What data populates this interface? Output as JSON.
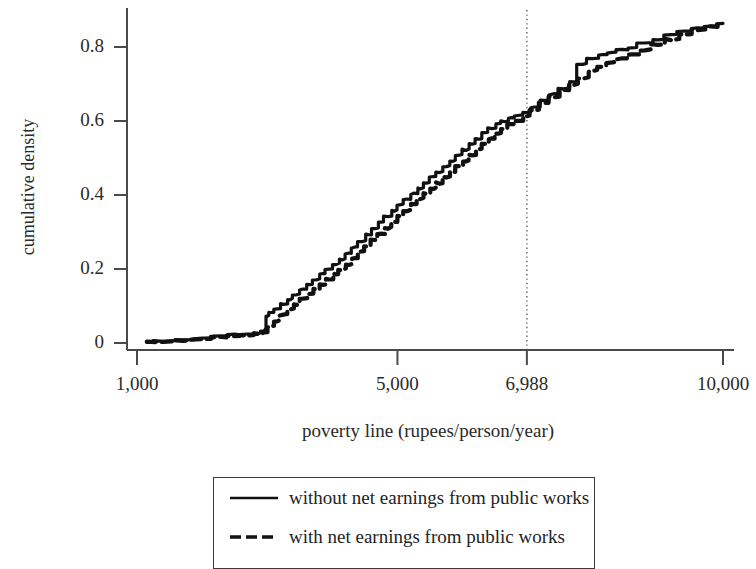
{
  "chart_data": {
    "type": "line",
    "title": "",
    "xlabel": "poverty line (rupees/person/year)",
    "ylabel": "cumulative density",
    "xlim": [
      1000,
      10000
    ],
    "ylim": [
      0,
      0.9
    ],
    "grid": false,
    "legend_position": "bottom",
    "xticks": [
      1000,
      5000,
      6988,
      10000
    ],
    "xtick_labels": [
      "1,000",
      "5,000",
      "6,988",
      "10,000"
    ],
    "yticks": [
      0,
      0.2,
      0.4,
      0.6,
      0.8
    ],
    "ytick_labels": [
      "0",
      "0.2",
      "0.4",
      "0.6",
      "0.8"
    ],
    "annotations": [
      {
        "name": "official-poverty-line-marker",
        "type": "vertical-dotted-line",
        "x": 6988,
        "label": "6,988"
      }
    ],
    "series": [
      {
        "name": "without net earnings from public works",
        "style": "solid",
        "color": "#111111",
        "x": [
          1150,
          1400,
          1700,
          2000,
          2300,
          2500,
          2700,
          2850,
          2950,
          3000,
          3050,
          3150,
          3250,
          3350,
          3450,
          3550,
          3650,
          3750,
          3850,
          3950,
          4050,
          4150,
          4250,
          4350,
          4450,
          4550,
          4650,
          4750,
          4850,
          4950,
          5050,
          5150,
          5250,
          5350,
          5450,
          5550,
          5650,
          5750,
          5850,
          5950,
          6050,
          6150,
          6250,
          6350,
          6450,
          6550,
          6650,
          6750,
          6850,
          6988,
          7100,
          7250,
          7400,
          7550,
          7700,
          7850,
          8000,
          8150,
          8300,
          8450,
          8600,
          8800,
          9000,
          9200,
          9400,
          9600,
          9800,
          10000
        ],
        "y": [
          0.003,
          0.006,
          0.009,
          0.013,
          0.018,
          0.022,
          0.024,
          0.027,
          0.031,
          0.072,
          0.082,
          0.092,
          0.105,
          0.118,
          0.131,
          0.145,
          0.158,
          0.172,
          0.186,
          0.2,
          0.213,
          0.225,
          0.242,
          0.258,
          0.275,
          0.292,
          0.308,
          0.325,
          0.341,
          0.358,
          0.373,
          0.388,
          0.403,
          0.418,
          0.432,
          0.448,
          0.462,
          0.478,
          0.492,
          0.508,
          0.522,
          0.538,
          0.552,
          0.568,
          0.58,
          0.592,
          0.6,
          0.608,
          0.615,
          0.622,
          0.636,
          0.655,
          0.672,
          0.688,
          0.705,
          0.754,
          0.768,
          0.778,
          0.785,
          0.792,
          0.798,
          0.81,
          0.82,
          0.832,
          0.842,
          0.85,
          0.856,
          0.862
        ]
      },
      {
        "name": "with net earnings from public works",
        "style": "dashed",
        "color": "#111111",
        "x": [
          1150,
          1400,
          1700,
          2000,
          2300,
          2500,
          2700,
          2850,
          2950,
          3050,
          3150,
          3250,
          3350,
          3450,
          3550,
          3650,
          3750,
          3850,
          3950,
          4050,
          4150,
          4250,
          4350,
          4450,
          4550,
          4650,
          4750,
          4850,
          4950,
          5050,
          5150,
          5250,
          5350,
          5450,
          5550,
          5650,
          5750,
          5850,
          5950,
          6050,
          6150,
          6250,
          6350,
          6450,
          6550,
          6650,
          6750,
          6850,
          6988,
          7100,
          7250,
          7400,
          7550,
          7700,
          7850,
          8000,
          8150,
          8300,
          8450,
          8600,
          8800,
          9000,
          9200,
          9400,
          9600,
          9800,
          10000
        ],
        "y": [
          0.002,
          0.004,
          0.007,
          0.011,
          0.015,
          0.019,
          0.021,
          0.024,
          0.027,
          0.043,
          0.06,
          0.075,
          0.09,
          0.104,
          0.118,
          0.132,
          0.145,
          0.158,
          0.172,
          0.186,
          0.198,
          0.212,
          0.228,
          0.246,
          0.262,
          0.278,
          0.294,
          0.31,
          0.326,
          0.342,
          0.358,
          0.374,
          0.39,
          0.404,
          0.418,
          0.432,
          0.448,
          0.462,
          0.478,
          0.492,
          0.508,
          0.522,
          0.538,
          0.552,
          0.566,
          0.578,
          0.59,
          0.6,
          0.612,
          0.628,
          0.648,
          0.665,
          0.682,
          0.698,
          0.715,
          0.735,
          0.748,
          0.758,
          0.768,
          0.778,
          0.792,
          0.806,
          0.82,
          0.834,
          0.846,
          0.854,
          0.862
        ]
      }
    ]
  }
}
